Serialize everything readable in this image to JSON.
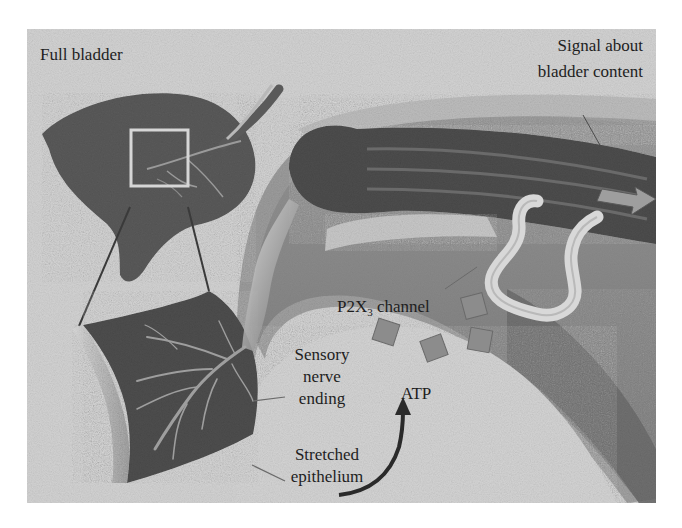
{
  "diagram": {
    "colors": {
      "background": "#ffffff",
      "frame_fill": "#d2d2d2",
      "bladder_dark": "#5a5a5a",
      "tissue_dark": "#4e4e4e",
      "nerve_light": "#c4c4c4",
      "channel": "#8c8c8c",
      "arrow": "#2a2a2a",
      "text": "#1e1e1e"
    },
    "labels": {
      "full_bladder": "Full bladder",
      "signal_line1": "Signal about",
      "signal_line2": "bladder content",
      "p2x3_prefix": "P2X",
      "p2x3_sub": "3",
      "p2x3_suffix": " channel",
      "sensory_line1": "Sensory",
      "sensory_line2": "nerve",
      "sensory_line3": "ending",
      "atp": "ATP",
      "stretched_line1": "Stretched",
      "stretched_line2": "epithelium"
    },
    "components": [
      "full-bladder",
      "zoom-box",
      "epithelium-tissue-section",
      "sensory-nerve-fiber",
      "nerve-bundle-arc",
      "p2x3-channels",
      "atp-release-arrow",
      "signal-arrow"
    ]
  }
}
